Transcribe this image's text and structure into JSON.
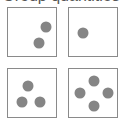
{
  "header": {
    "text": "Group quantities"
  },
  "colors": {
    "border": "#8a8a8a",
    "dot": "#858585",
    "background": "#ffffff"
  },
  "boxes": [
    {
      "id": "box-1",
      "count": 2,
      "position": {
        "left": 7,
        "top": 7
      },
      "dots": [
        {
          "x": 38,
          "y": 19
        },
        {
          "x": 31,
          "y": 35
        }
      ]
    },
    {
      "id": "box-2",
      "count": 1,
      "position": {
        "left": 68,
        "top": 7
      },
      "dots": [
        {
          "x": 14,
          "y": 25
        }
      ]
    },
    {
      "id": "box-3",
      "count": 3,
      "position": {
        "left": 7,
        "top": 68
      },
      "dots": [
        {
          "x": 20,
          "y": 17
        },
        {
          "x": 14,
          "y": 33
        },
        {
          "x": 32,
          "y": 33
        }
      ]
    },
    {
      "id": "box-4",
      "count": 4,
      "position": {
        "left": 68,
        "top": 68
      },
      "dots": [
        {
          "x": 25,
          "y": 12
        },
        {
          "x": 11,
          "y": 24
        },
        {
          "x": 39,
          "y": 24
        },
        {
          "x": 25,
          "y": 37
        }
      ]
    }
  ]
}
